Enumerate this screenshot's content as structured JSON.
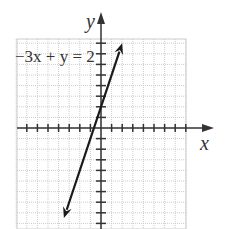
{
  "chart_data": {
    "type": "line",
    "title": "",
    "xlabel": "x",
    "ylabel": "y",
    "equation_label": "−3x + y = 2",
    "tick_labels": [
      "2"
    ],
    "grid": true,
    "xlim": [
      -8,
      8
    ],
    "ylim": [
      -9,
      9
    ],
    "series": [
      {
        "name": "−3x + y = 2",
        "slope": 3,
        "intercept": 2,
        "x": [
          -3.5,
          0,
          2
        ],
        "y": [
          -8.5,
          2,
          8
        ]
      }
    ],
    "colors": {
      "line": "#1a1a1a",
      "axis": "#333333",
      "grid": "#cccccc"
    }
  }
}
